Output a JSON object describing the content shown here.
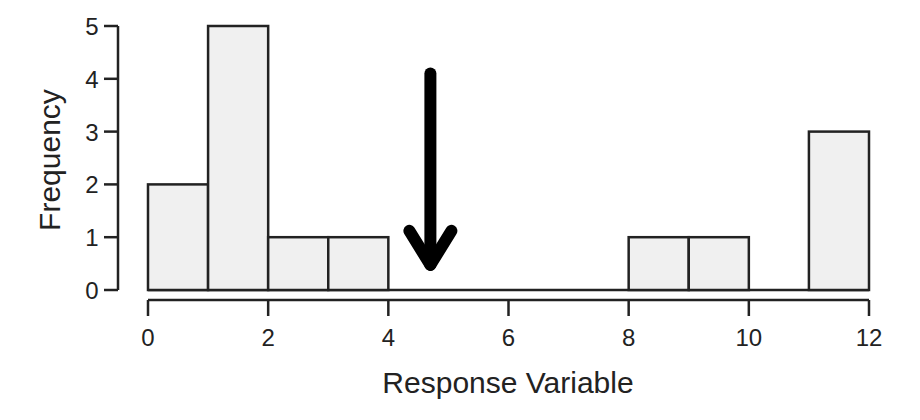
{
  "chart_data": {
    "type": "bar",
    "subtype": "histogram",
    "title": "",
    "xlabel": "Response Variable",
    "ylabel": "Frequency",
    "bins": [
      [
        0,
        1
      ],
      [
        1,
        2
      ],
      [
        2,
        3
      ],
      [
        3,
        4
      ],
      [
        4,
        5
      ],
      [
        5,
        6
      ],
      [
        6,
        7
      ],
      [
        7,
        8
      ],
      [
        8,
        9
      ],
      [
        9,
        10
      ],
      [
        10,
        11
      ],
      [
        11,
        12
      ]
    ],
    "values": [
      2,
      5,
      1,
      1,
      0,
      0,
      0,
      0,
      1,
      1,
      0,
      3
    ],
    "xlim": [
      0,
      12
    ],
    "ylim": [
      0,
      5
    ],
    "xticks": [
      "0",
      "2",
      "4",
      "6",
      "8",
      "10",
      "12"
    ],
    "yticks": [
      "0",
      "1",
      "2",
      "3",
      "4",
      "5"
    ],
    "grid": false,
    "legend": null,
    "annotations": [
      {
        "type": "arrow",
        "direction": "down",
        "x": 4.7,
        "y_from": 4.1,
        "y_to": 0.4,
        "color": "#000000"
      }
    ],
    "colors": {
      "bar_fill": "#f0f0f0",
      "bar_edge": "#222222",
      "axis": "#222222"
    }
  }
}
